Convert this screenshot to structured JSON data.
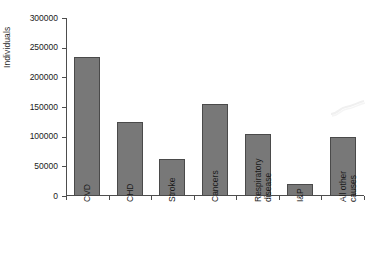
{
  "chart_data": {
    "type": "bar",
    "title": "",
    "subtitle": "",
    "xlabel": "",
    "ylabel": "Individuals",
    "ylim": [
      0,
      300000
    ],
    "ytick_interval": 50000,
    "yticks": [
      0,
      50000,
      100000,
      150000,
      200000,
      250000,
      300000
    ],
    "ytick_labels": [
      "0",
      "50000",
      "100000",
      "150000",
      "200000",
      "250000",
      "300000"
    ],
    "grid": false,
    "legend": false,
    "legend_position": "none",
    "categories": [
      "CVD",
      "CHD",
      "Stroke",
      "Cancers",
      "Respiratory disease",
      "I&P",
      "All other causes"
    ],
    "category_label_lines": [
      [
        "CVD"
      ],
      [
        "CHD"
      ],
      [
        "Stroke"
      ],
      [
        "Cancers"
      ],
      [
        "Respiratory",
        "disease"
      ],
      [
        "I&P"
      ],
      [
        "All other",
        "causes"
      ]
    ],
    "values": [
      235000,
      124000,
      62000,
      155000,
      105000,
      20000,
      99000
    ],
    "bar_color": "#787878",
    "bar_edge_color": "#4a4a4a",
    "axis_color": "#4d4d4d",
    "background_color": "#ffffff"
  },
  "annotations": {
    "scan_artifact": "faint-scan-mark"
  }
}
